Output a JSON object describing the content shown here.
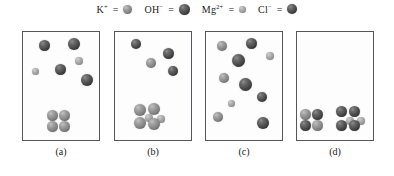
{
  "legend": {
    "items": [
      {
        "id": "potassium",
        "formula": "K",
        "charge": "+",
        "equals": "=",
        "species": "K+",
        "sphere": "mid",
        "size": 9
      },
      {
        "id": "hydroxide",
        "formula": "OH",
        "charge": "−",
        "equals": "=",
        "species": "OH-",
        "sphere": "dark",
        "size": 11
      },
      {
        "id": "magnesium",
        "formula": "Mg",
        "charge": "2+",
        "equals": "=",
        "species": "Mg2+",
        "sphere": "light",
        "size": 7
      },
      {
        "id": "chloride",
        "formula": "Cl",
        "charge": "−",
        "equals": "=",
        "species": "Cl-",
        "sphere": "dark",
        "size": 10
      }
    ]
  },
  "colors": {
    "dark_sphere": "#2e2e2e",
    "mid_sphere": "#858585",
    "light_sphere": "#9a9a9a",
    "panel_border": "#55555b",
    "background": "#ffffff",
    "text": "#1a1a1a"
  },
  "panels": [
    {
      "id": "panel-a",
      "label": "(a)",
      "box": {
        "x": 22,
        "y": 31,
        "width": 78,
        "height": 110
      },
      "label_pos": {
        "x": 22,
        "y": 146,
        "width": 78
      },
      "particles": [
        {
          "sphere": "dark",
          "size": 11,
          "x": 16,
          "y": 8
        },
        {
          "sphere": "dark",
          "size": 12,
          "x": 45,
          "y": 6
        },
        {
          "sphere": "light",
          "size": 8,
          "x": 52,
          "y": 25
        },
        {
          "sphere": "dark",
          "size": 11,
          "x": 32,
          "y": 32
        },
        {
          "sphere": "light",
          "size": 7,
          "x": 9,
          "y": 36
        },
        {
          "sphere": "dark",
          "size": 12,
          "x": 58,
          "y": 42
        },
        {
          "sphere": "mid",
          "size": 11,
          "x": 24,
          "y": 78
        },
        {
          "sphere": "mid",
          "size": 11,
          "x": 36,
          "y": 78
        },
        {
          "sphere": "mid",
          "size": 11,
          "x": 24,
          "y": 89
        },
        {
          "sphere": "mid",
          "size": 11,
          "x": 36,
          "y": 89
        }
      ]
    },
    {
      "id": "panel-b",
      "label": "(b)",
      "box": {
        "x": 114,
        "y": 31,
        "width": 78,
        "height": 110
      },
      "label_pos": {
        "x": 114,
        "y": 146,
        "width": 78
      },
      "particles": [
        {
          "sphere": "dark",
          "size": 10,
          "x": 16,
          "y": 7
        },
        {
          "sphere": "dark",
          "size": 11,
          "x": 48,
          "y": 16
        },
        {
          "sphere": "mid",
          "size": 10,
          "x": 31,
          "y": 26
        },
        {
          "sphere": "dark",
          "size": 10,
          "x": 53,
          "y": 34
        },
        {
          "sphere": "mid",
          "size": 12,
          "x": 19,
          "y": 72
        },
        {
          "sphere": "mid",
          "size": 12,
          "x": 33,
          "y": 71
        },
        {
          "sphere": "light",
          "size": 8,
          "x": 30,
          "y": 82
        },
        {
          "sphere": "light",
          "size": 8,
          "x": 42,
          "y": 83
        },
        {
          "sphere": "mid",
          "size": 12,
          "x": 19,
          "y": 85
        },
        {
          "sphere": "mid",
          "size": 12,
          "x": 33,
          "y": 86
        }
      ]
    },
    {
      "id": "panel-c",
      "label": "(c)",
      "box": {
        "x": 205,
        "y": 31,
        "width": 78,
        "height": 110
      },
      "label_pos": {
        "x": 205,
        "y": 146,
        "width": 78
      },
      "particles": [
        {
          "sphere": "mid",
          "size": 10,
          "x": 11,
          "y": 9
        },
        {
          "sphere": "dark",
          "size": 11,
          "x": 40,
          "y": 6
        },
        {
          "sphere": "light",
          "size": 8,
          "x": 60,
          "y": 20
        },
        {
          "sphere": "dark",
          "size": 13,
          "x": 26,
          "y": 22
        },
        {
          "sphere": "mid",
          "size": 10,
          "x": 13,
          "y": 41
        },
        {
          "sphere": "dark",
          "size": 13,
          "x": 33,
          "y": 46
        },
        {
          "sphere": "dark",
          "size": 10,
          "x": 51,
          "y": 60
        },
        {
          "sphere": "light",
          "size": 7,
          "x": 22,
          "y": 68
        },
        {
          "sphere": "mid",
          "size": 10,
          "x": 7,
          "y": 80
        },
        {
          "sphere": "dark",
          "size": 12,
          "x": 51,
          "y": 85
        }
      ]
    },
    {
      "id": "panel-d",
      "label": "(d)",
      "box": {
        "x": 296,
        "y": 31,
        "width": 78,
        "height": 110
      },
      "label_pos": {
        "x": 296,
        "y": 146,
        "width": 78
      },
      "particles": [
        {
          "sphere": "mid",
          "size": 11,
          "x": 3,
          "y": 77
        },
        {
          "sphere": "dark",
          "size": 11,
          "x": 15,
          "y": 77
        },
        {
          "sphere": "dark",
          "size": 11,
          "x": 3,
          "y": 88
        },
        {
          "sphere": "mid",
          "size": 11,
          "x": 15,
          "y": 88
        },
        {
          "sphere": "dark",
          "size": 11,
          "x": 39,
          "y": 74
        },
        {
          "sphere": "dark",
          "size": 11,
          "x": 52,
          "y": 74
        },
        {
          "sphere": "light",
          "size": 8,
          "x": 49,
          "y": 85
        },
        {
          "sphere": "light",
          "size": 8,
          "x": 60,
          "y": 85
        },
        {
          "sphere": "dark",
          "size": 11,
          "x": 39,
          "y": 88
        },
        {
          "sphere": "dark",
          "size": 11,
          "x": 52,
          "y": 88
        }
      ]
    }
  ]
}
